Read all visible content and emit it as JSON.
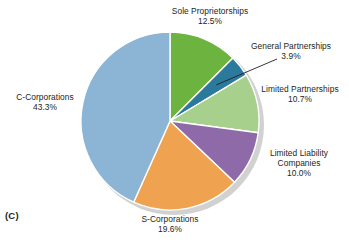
{
  "figure": {
    "marker": "(C)"
  },
  "chart_data": {
    "type": "pie",
    "title": "",
    "start_angle_deg": 0,
    "direction": "clockwise",
    "legend": "labels-outside-with-leader-lines",
    "grid": false,
    "center": {
      "x": 170,
      "y": 121,
      "r": 89
    },
    "shadow_color": "#c9c9c9",
    "slice_border_color": "#ffffff",
    "categories": [
      "Sole Proprietorships",
      "General Partnerships",
      "Limited Partnerships",
      "Limited Liability Companies",
      "S-Corporations",
      "C-Corporations"
    ],
    "values": [
      12.5,
      3.9,
      10.7,
      10.0,
      19.6,
      43.3
    ],
    "value_labels": [
      "12.5%",
      "3.9%",
      "10.7%",
      "10.0%",
      "19.6%",
      "43.3%"
    ],
    "colors": [
      "#6cb33f",
      "#2b7a9e",
      "#a8d08d",
      "#8e6ba8",
      "#efa351",
      "#8cb4d4"
    ],
    "slices": [
      {
        "name": "Sole Proprietorships",
        "label_line1": "Sole Proprietorships",
        "value": 12.5,
        "value_label": "12.5%",
        "color": "#6cb33f",
        "leader_line": false
      },
      {
        "name": "General Partnerships",
        "label_line1": "General Partnerships",
        "value": 3.9,
        "value_label": "3.9%",
        "color": "#2b7a9e",
        "leader_line": true
      },
      {
        "name": "Limited Partnerships",
        "label_line1": "Limited Partnerships",
        "value": 10.7,
        "value_label": "10.7%",
        "color": "#a8d08d",
        "leader_line": false
      },
      {
        "name": "Limited Liability Companies",
        "label_line1": "Limited Liability",
        "label_line2": "Companies",
        "value": 10.0,
        "value_label": "10.0%",
        "color": "#8e6ba8",
        "leader_line": false
      },
      {
        "name": "S-Corporations",
        "label_line1": "S-Corporations",
        "value": 19.6,
        "value_label": "19.6%",
        "color": "#efa351",
        "leader_line": false
      },
      {
        "name": "C-Corporations",
        "label_line1": "C-Corporations",
        "value": 43.3,
        "value_label": "43.3%",
        "color": "#8cb4d4",
        "leader_line": false
      }
    ]
  }
}
